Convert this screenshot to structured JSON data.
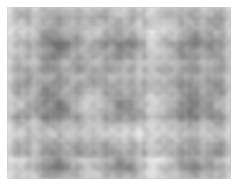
{
  "image": {
    "kind": "grayscale-noise-texture",
    "description": "Cloudy grayscale random-noise texture plate on a white page background",
    "width_px": 237,
    "height_px": 187,
    "colorspace": "grayscale",
    "page_background": "#ffffff",
    "plate": {
      "left_px": 7,
      "top_px": 7,
      "width_px": 224,
      "height_px": 172,
      "base_tone": "#a6a6a6",
      "lightest_tone": "#c8c8c8",
      "darkest_tone": "#848484",
      "mean_tone": "#a8a8a8"
    },
    "texture": {
      "pattern": "perlin-like cloud noise",
      "blob_scale_px": 16,
      "octaves": 4,
      "has_vertical_grain": true,
      "contrast": "low"
    }
  },
  "overlays": {
    "has_text": false,
    "has_axes": false,
    "has_legend": false,
    "has_ui_chrome": false,
    "labels": []
  }
}
